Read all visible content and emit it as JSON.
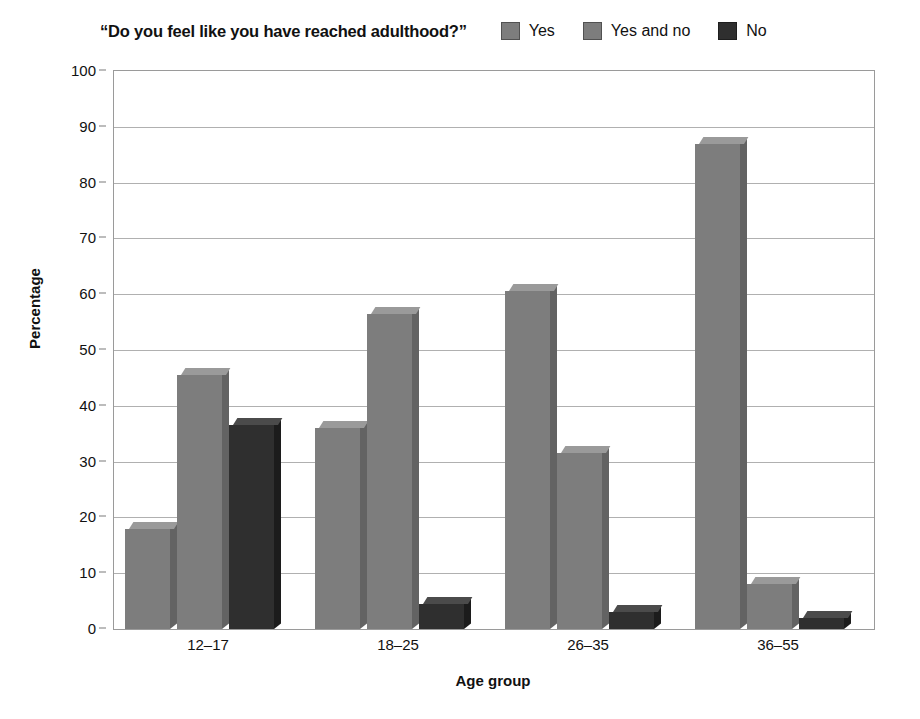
{
  "chart_data": {
    "type": "bar",
    "title": "“Do you feel like you have reached adulthood?”",
    "xlabel": "Age group",
    "ylabel": "Percentage",
    "ylim": [
      0,
      100
    ],
    "ytick_step": 10,
    "grid": true,
    "legend_position": "top-right",
    "categories": [
      "12–17",
      "18–25",
      "26–35",
      "36–55"
    ],
    "series": [
      {
        "name": "Yes",
        "color": "#7d7d7d",
        "values": [
          18,
          36,
          60.5,
          87
        ]
      },
      {
        "name": "Yes and no",
        "color": "#7d7d7d",
        "values": [
          45.5,
          56.5,
          31.5,
          8
        ]
      },
      {
        "name": "No",
        "color": "#2f2f2f",
        "values": [
          36.5,
          4.5,
          3,
          2
        ]
      }
    ],
    "yticks": [
      "0",
      "10",
      "20",
      "30",
      "40",
      "50",
      "60",
      "70",
      "80",
      "90",
      "100"
    ]
  },
  "legend": {
    "items": [
      {
        "label": "Yes",
        "swatch": "legend-swatch-yes",
        "color": "#7d7d7d"
      },
      {
        "label": "Yes and no",
        "swatch": "legend-swatch-yes-and-no",
        "color": "#7d7d7d"
      },
      {
        "label": "No",
        "swatch": "legend-swatch-no",
        "color": "#2f2f2f"
      }
    ]
  }
}
